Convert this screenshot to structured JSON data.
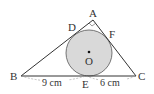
{
  "diagram": {
    "type": "geometry",
    "points": {
      "A": {
        "label": "A",
        "x": 93,
        "y": 20
      },
      "B": {
        "label": "B",
        "x": 21,
        "y": 76
      },
      "C": {
        "label": "C",
        "x": 136,
        "y": 76
      },
      "D": {
        "label": "D",
        "x": 78,
        "y": 31
      },
      "E": {
        "label": "E",
        "x": 86,
        "y": 76
      },
      "F": {
        "label": "F",
        "x": 107,
        "y": 37
      },
      "O": {
        "label": "O",
        "x": 89,
        "y": 53
      }
    },
    "circle": {
      "center": "O",
      "radius": 23,
      "fill": "#d9d9d9",
      "stroke": "#555555"
    },
    "right_angle_at": "A",
    "measurements": {
      "BE": "9 cm",
      "EC": "6 cm"
    },
    "colors": {
      "line": "#333333",
      "circle_fill": "#d9d9d9",
      "dashed": "#999999"
    }
  }
}
